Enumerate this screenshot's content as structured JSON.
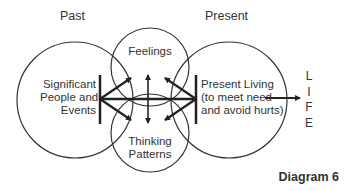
{
  "headers": {
    "past": "Past",
    "present": "Present"
  },
  "circles": {
    "left": {
      "lines": [
        "Significant",
        "People and",
        "Events"
      ]
    },
    "top": {
      "label": "Feelings"
    },
    "bottom": {
      "lines": [
        "Thinking",
        "Patterns"
      ]
    },
    "right": {
      "lines": [
        "Present Living",
        "(to meet need",
        "and avoid hurts)"
      ]
    }
  },
  "outcome": {
    "letters": [
      "L",
      "I",
      "F",
      "E"
    ]
  },
  "caption": "Diagram 6",
  "colors": {
    "stroke": "#222222",
    "text": "#333333",
    "background": "#ffffff"
  }
}
